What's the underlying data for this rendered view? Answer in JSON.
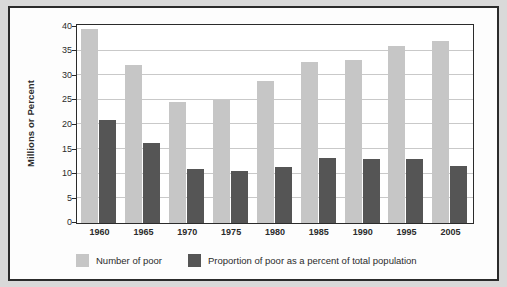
{
  "chart_data": {
    "type": "bar",
    "title": "",
    "subtitle": "",
    "xlabel": "",
    "ylabel": "Millions or Percent",
    "ylim": [
      0,
      40
    ],
    "ytick_step": 5,
    "yticks": [
      "0",
      "5",
      "10",
      "15",
      "20",
      "25",
      "30",
      "35",
      "40"
    ],
    "grid": true,
    "legend_position": "bottom",
    "categories": [
      "1960",
      "1965",
      "1970",
      "1975",
      "1980",
      "1985",
      "1990",
      "1995",
      "2005"
    ],
    "series": [
      {
        "name": "Number of poor",
        "color": "#c6c6c6",
        "values": [
          39.5,
          32.2,
          24.6,
          25.0,
          28.9,
          32.8,
          33.2,
          35.9,
          37.0
        ]
      },
      {
        "name": "Proportion of poor as a percent of total population",
        "color": "#555555",
        "values": [
          21.0,
          16.3,
          11.0,
          10.6,
          11.4,
          13.3,
          13.1,
          13.0,
          11.5
        ]
      }
    ]
  },
  "legend": {
    "entries": [
      {
        "label": "Number of poor",
        "swatch": "light"
      },
      {
        "label": "Proportion of poor as a percent of total population",
        "swatch": "dark"
      }
    ]
  },
  "colors": {
    "series_light": "#c6c6c6",
    "series_dark": "#555555",
    "frame": "#2b2b2b",
    "gridline": "#c9c9c9",
    "page_background": "#d9d9d9",
    "plot_background": "#ffffff"
  }
}
